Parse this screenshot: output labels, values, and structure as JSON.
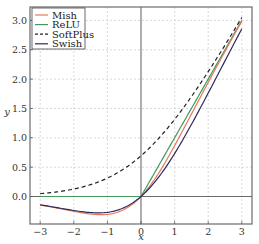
{
  "chart_data": {
    "type": "line",
    "title": "",
    "xlabel": "x",
    "ylabel": "y",
    "xlim": [
      -3.33,
      3.3
    ],
    "ylim": [
      -0.47,
      3.22
    ],
    "xticks": [
      -3,
      -2,
      -1,
      0,
      1,
      2,
      3
    ],
    "xtick_labels": [
      "−3",
      "−2",
      "−1",
      "0",
      "1",
      "2",
      "3"
    ],
    "yticks": [
      0.0,
      0.5,
      1.0,
      1.5,
      2.0,
      2.5,
      3.0
    ],
    "ytick_labels": [
      "0.0",
      "0.5",
      "1.0",
      "1.5",
      "2.0",
      "2.5",
      "3.0"
    ],
    "grid": true,
    "legend_position": "upper left",
    "x": [
      -3,
      -2.5,
      -2,
      -1.5,
      -1,
      -0.5,
      0,
      0.5,
      1,
      1.5,
      2,
      2.5,
      3
    ],
    "series": [
      {
        "name": "Mish",
        "color": "#e8795e",
        "dash": "solid",
        "values": [
          -0.146,
          -0.19,
          -0.252,
          -0.303,
          -0.303,
          -0.222,
          0.0,
          0.375,
          0.865,
          1.404,
          1.944,
          2.471,
          2.987
        ]
      },
      {
        "name": "ReLU",
        "color": "#3f9a5c",
        "dash": "solid",
        "values": [
          0,
          0,
          0,
          0,
          0,
          0,
          0,
          0.5,
          1.0,
          1.5,
          2.0,
          2.5,
          3.0
        ]
      },
      {
        "name": "SoftPlus",
        "color": "#222222",
        "dash": "dashed",
        "values": [
          0.049,
          0.079,
          0.127,
          0.201,
          0.313,
          0.474,
          0.693,
          0.974,
          1.313,
          1.701,
          2.127,
          2.579,
          3.049
        ]
      },
      {
        "name": "Swish",
        "color": "#2b2b5e",
        "dash": "solid",
        "values": [
          -0.142,
          -0.19,
          -0.238,
          -0.274,
          -0.269,
          -0.189,
          0.0,
          0.311,
          0.731,
          1.227,
          1.762,
          2.311,
          2.858
        ]
      }
    ]
  },
  "legend": {
    "items": [
      {
        "label": "Mish"
      },
      {
        "label": "ReLU"
      },
      {
        "label": "SoftPlus"
      },
      {
        "label": "Swish"
      }
    ]
  },
  "axes": {
    "xlabel": "x",
    "ylabel": "y"
  }
}
